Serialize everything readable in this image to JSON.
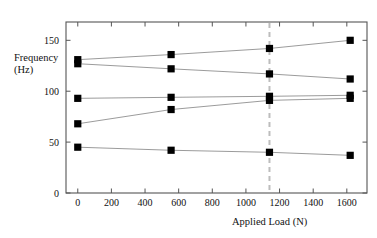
{
  "chart_data": {
    "type": "scatter",
    "title": "",
    "xlabel": "Applied Load (N)",
    "ylabel_line1": "Frequency",
    "ylabel_line2": "(Hz)",
    "xlim": [
      -70,
      1720
    ],
    "ylim": [
      0,
      168
    ],
    "xticks": [
      0,
      200,
      400,
      600,
      800,
      1000,
      1200,
      1400,
      1600
    ],
    "xticklabels": [
      "0",
      "200",
      "400",
      "600",
      "800",
      "1000",
      "1200",
      "1400",
      "1600"
    ],
    "yticks": [
      0,
      50,
      100,
      150
    ],
    "yticklabels": [
      "0",
      "50",
      "100",
      "150"
    ],
    "grid": false,
    "legend": "none",
    "marker": "filled-square",
    "marker_color": "#000000",
    "line_color": "#909090",
    "frame_color": "#555555",
    "annotations": [
      {
        "name": "design-load-reference",
        "type": "vline",
        "x": 1140,
        "style": "dashed",
        "color": "#bdbdbd"
      }
    ],
    "x": [
      0,
      555,
      1140,
      1620
    ],
    "series": [
      {
        "name": "mode-1",
        "values": [
          131,
          136,
          142,
          150
        ]
      },
      {
        "name": "mode-2",
        "values": [
          127,
          122,
          117,
          112
        ]
      },
      {
        "name": "mode-3",
        "values": [
          93,
          94,
          95,
          96
        ]
      },
      {
        "name": "mode-4",
        "values": [
          68,
          82,
          91,
          93
        ]
      },
      {
        "name": "mode-5",
        "values": [
          45,
          42,
          40,
          37
        ]
      }
    ]
  }
}
